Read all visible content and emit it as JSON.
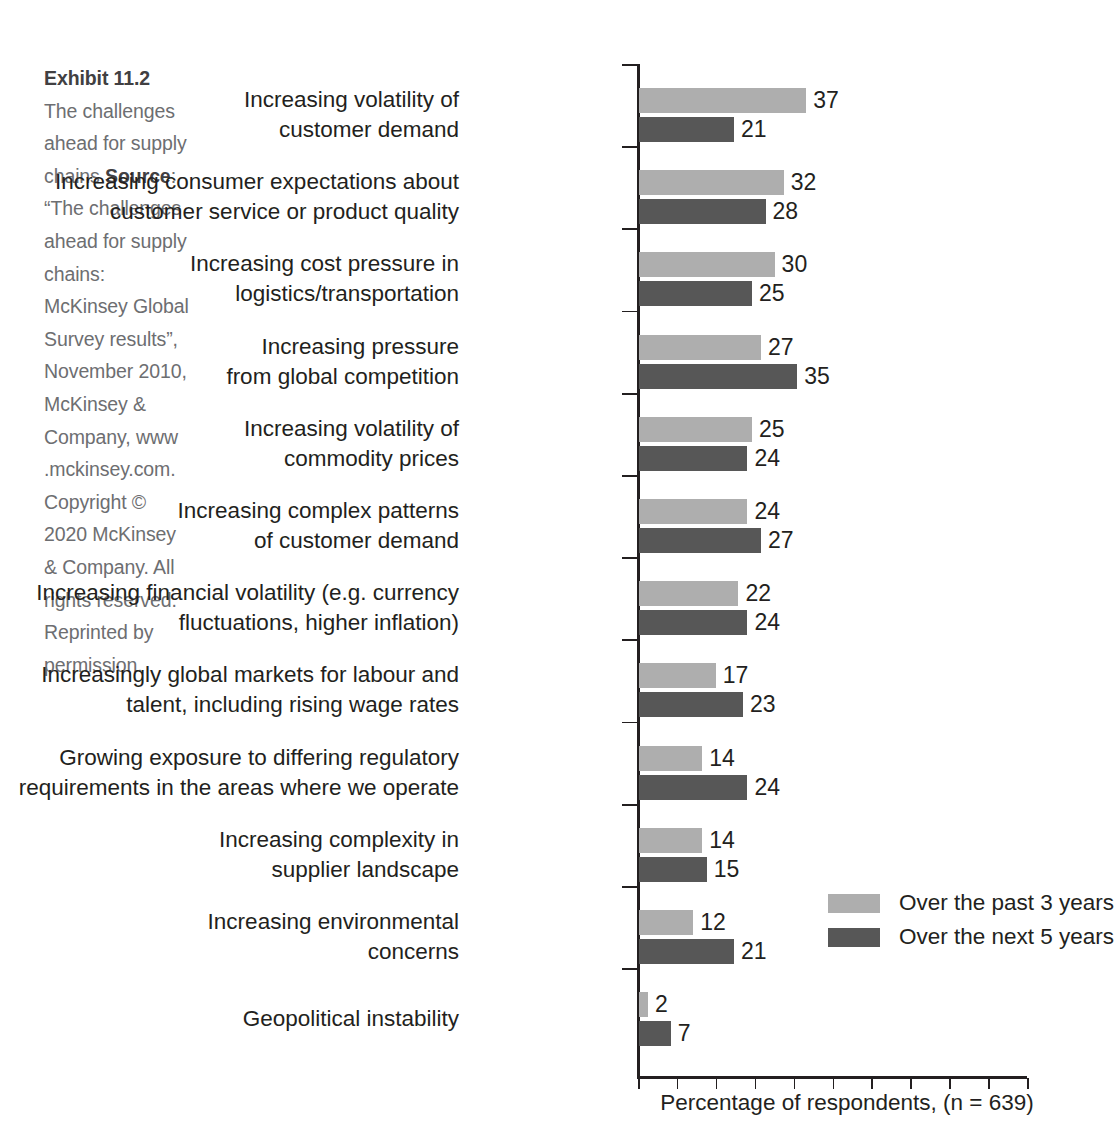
{
  "caption": {
    "exhibit_number": "Exhibit 11.2",
    "title": "The challenges ahead for supply chains",
    "source_label": "Source",
    "source_text": ": “The challenges ahead for supply chains: McKinsey Global Survey results”, November 2010, McKinsey & Company, www .mckinsey.com. Copyright © 2020 McKinsey & Company. All rights reserved. Reprinted by permission."
  },
  "chart_data": {
    "type": "bar",
    "orientation": "horizontal",
    "title": "The challenges ahead for supply chains",
    "xlabel": "Percentage of respondents, (n = 639)",
    "ylabel": "",
    "xlim": [
      0,
      50
    ],
    "grid": false,
    "legend_position": "middle-right",
    "value_labels": true,
    "categories": [
      "Increasing volatility of\ncustomer demand",
      "Increasing consumer expectations about\ncustomer service or product quality",
      "Increasing cost pressure in\nlogistics/transportation",
      "Increasing pressure\nfrom global competition",
      "Increasing volatility of\ncommodity prices",
      "Increasing complex patterns\nof customer demand",
      "Increasing financial volatility (e.g. currency\nfluctuations, higher inflation)",
      "Increasingly global markets for labour and\ntalent, including rising wage rates",
      "Growing exposure to differing regulatory\nrequirements in the areas where we operate",
      "Increasing complexity in\nsupplier landscape",
      "Increasing environmental\nconcerns",
      "Geopolitical instability"
    ],
    "series": [
      {
        "name": "Over the past 3 years",
        "color": "#aeaeae",
        "values": [
          37,
          32,
          30,
          27,
          25,
          24,
          22,
          17,
          14,
          14,
          12,
          2
        ]
      },
      {
        "name": "Over the next 5 years",
        "color": "#575757",
        "values": [
          21,
          28,
          25,
          35,
          24,
          27,
          24,
          23,
          24,
          15,
          21,
          7
        ]
      }
    ],
    "x_tick_count": 11
  },
  "legend": {
    "items": [
      {
        "label": "Over the past 3 years",
        "swatch": "light"
      },
      {
        "label": "Over the next 5 years",
        "swatch": "dark"
      }
    ]
  },
  "axis": {
    "x_title": "Percentage of respondents, (n = 639)"
  }
}
